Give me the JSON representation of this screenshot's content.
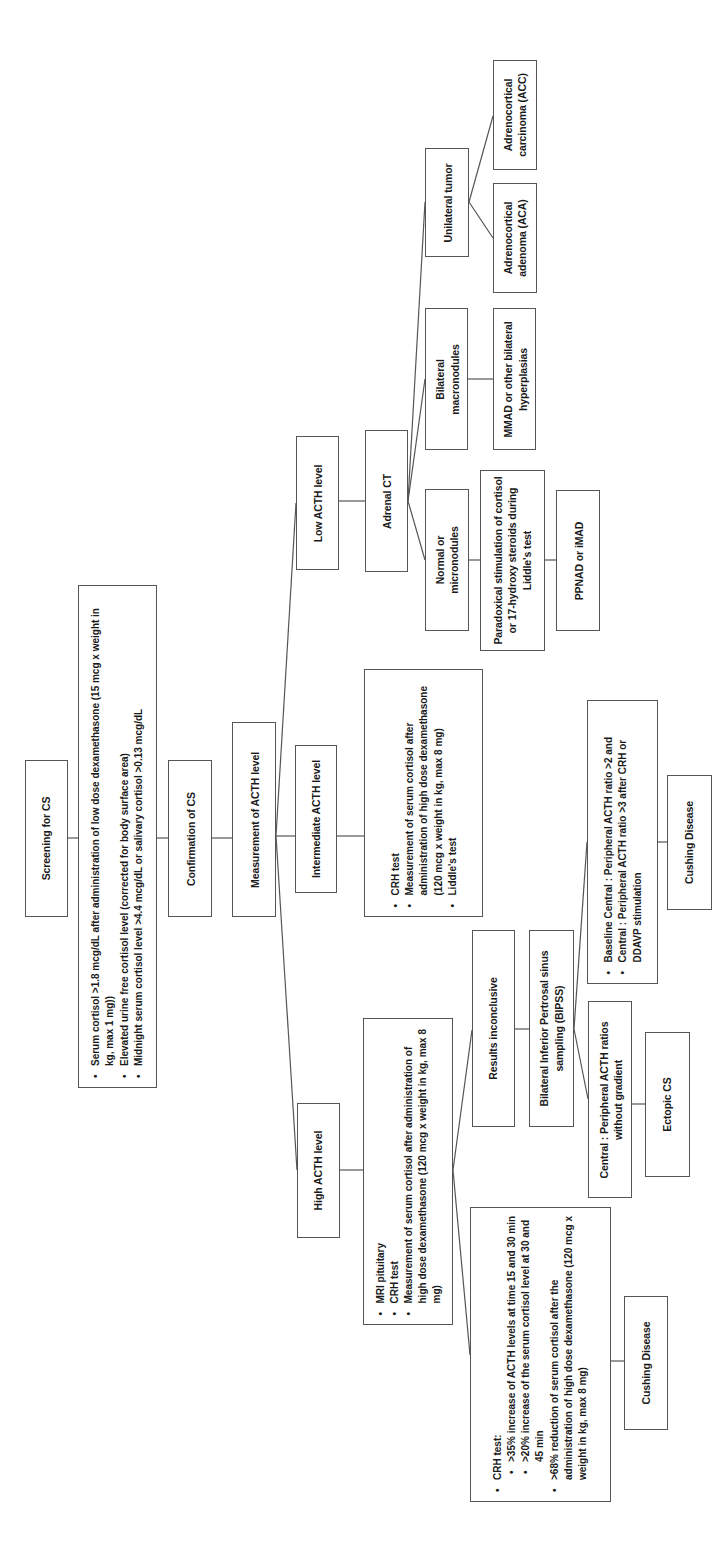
{
  "nodes": {
    "screening": {
      "label": "Screening for CS"
    },
    "screening_criteria": {
      "items": [
        "Serum cortisol >1.8 mcg/dL after administration of low dose dexamethasone (15 mcg x weight in kg, max 1 mg))",
        "Elevated urine free cortisol level (corrected for body surface area)",
        "Midnight serum cortisol level >4.4 mcg/dL or salivary cortisol >0.13 mcg/dL"
      ]
    },
    "confirmation": {
      "label": "Confirmation of CS"
    },
    "measurement": {
      "label": "Measurement of ACTH level"
    },
    "low_acth": {
      "label": "Low ACTH level"
    },
    "intermediate_acth": {
      "label": "Intermediate ACTH level"
    },
    "high_acth": {
      "label": "High ACTH level"
    },
    "intermediate_tests": {
      "items": [
        "CRH test",
        "Measurement of serum cortisol after administration of high dose dexamethasone (120 mcg x weight in kg, max 8 mg)",
        "Liddle's test"
      ]
    },
    "adrenal_ct": {
      "label": "Adrenal CT"
    },
    "normal_micro": {
      "label": "Normal or micronodules"
    },
    "bilateral_macro": {
      "label": "Bilateral macronodules"
    },
    "unilateral_tumor": {
      "label": "Unilateral tumor"
    },
    "paradoxical": {
      "label": "Paradoxical stimulation of cortisol or 17-hydroxy steroids during Liddle's test"
    },
    "ppnad": {
      "label": "PPNAD or iMAD"
    },
    "mmad": {
      "label": "MMAD or other bilateral hyperplasias"
    },
    "aca": {
      "label": "Adrenocortical adenoma (ACA)"
    },
    "acc": {
      "label": "Adrenocortical carcinoma (ACC)"
    },
    "high_tests": {
      "items": [
        "MRI pituitary",
        "CRH test",
        "Measurement of serum cortisol after administration of high dose dexamethasone (120 mcg x weight in kg, max 8 mg)"
      ]
    },
    "results_inconclusive": {
      "label": "Results inconclusive"
    },
    "bipss": {
      "label": "Bilateral Inferior Pertrosal sinus sampling (BIPSS)"
    },
    "bipss_positive": {
      "items": [
        "Baseline Central : Peripheral ACTH ratio >2 and",
        "Central : Peripheral ACTH ratio >3 after CRH or DDAVP stimulation"
      ]
    },
    "bipss_negative": {
      "label": "Central : Peripheral ACTH ratios without gradient"
    },
    "cushing_disease_bipss": {
      "label": "Cushing Disease"
    },
    "ectopic_cs": {
      "label": "Ectopic CS"
    },
    "crh_criteria": {
      "heading": "CRH test:",
      "sub_items": [
        ">35% increase of ACTH levels at time 15 and 30 min",
        ">20% increase of the serum cortisol level at 30 and 45 min"
      ],
      "item2": ">68% reduction of serum cortisol after the administration of high dose dexamethasone (120 mcg x weight in kg, max 8 mg)"
    },
    "cushing_disease_crh": {
      "label": "Cushing Disease"
    }
  }
}
